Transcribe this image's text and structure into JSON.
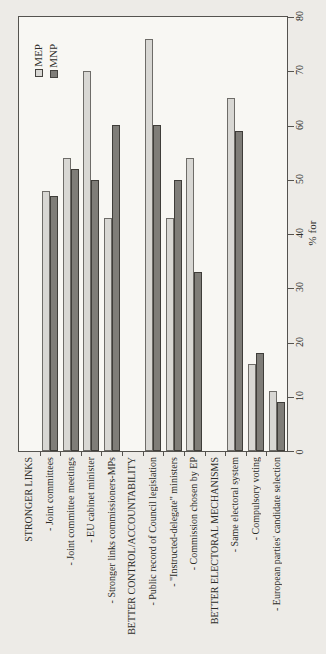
{
  "chart_data": {
    "type": "bar",
    "orientation": "whole_chart_rotated_90_ccw",
    "grid": "off",
    "value_axis": {
      "label": "% for",
      "min": 0,
      "max": 80,
      "tick_step": 10,
      "ticks": [
        0,
        10,
        20,
        30,
        40,
        50,
        60,
        70,
        80
      ]
    },
    "legend": {
      "position": "top-left-inside",
      "entries": [
        "MEP",
        "MNP"
      ]
    },
    "colors": {
      "MEP": "#d8d7d3",
      "MNP": "#7f7d78"
    },
    "categories": [
      "STRONGER LINKS",
      "- Joint committees",
      "- Joint committee meetings",
      "- EU cabinet minister",
      "- Stronger links commissioners-MPs",
      "BETTER CONTROL/ACCOUNTABILITY",
      "- Public record of Council legislation",
      "- \"Instructed-delegate\" ministers",
      "- Commission chosen by EP",
      "BETTER ELECTORAL MECHANISMS",
      "- Same electoral system",
      "- Compulsory voting",
      "- European parties' candidate selection"
    ],
    "header_rows": [
      0,
      5,
      9
    ],
    "series": [
      {
        "name": "MEP",
        "values": [
          null,
          48,
          54,
          70,
          43,
          null,
          76,
          43,
          54,
          null,
          65,
          16,
          11
        ]
      },
      {
        "name": "MNP",
        "values": [
          null,
          47,
          52,
          50,
          60,
          null,
          60,
          50,
          33,
          null,
          59,
          18,
          9
        ]
      }
    ]
  }
}
